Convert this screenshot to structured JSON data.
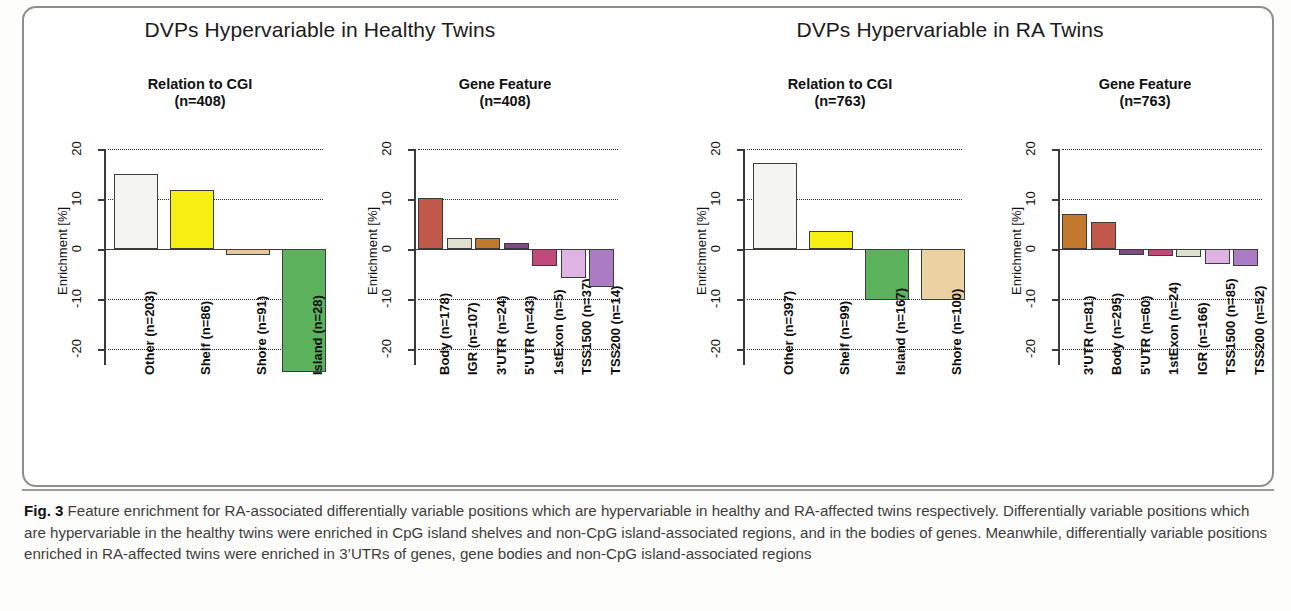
{
  "figure": {
    "label": "Fig. 3",
    "caption_text": " Feature enrichment for RA-associated differentially variable positions which are hypervariable in healthy and RA-affected twins respectively. Differentially variable positions which are hypervariable in the healthy twins were enriched in CpG island shelves and non-CpG island-associated regions, and in the bodies of genes. Meanwhile, differentially variable positions enriched in RA-affected twins were enriched in 3’UTRs of genes, gene bodies and non-CpG island-associated regions"
  },
  "groups": [
    {
      "title": "DVPs Hypervariable in Healthy Twins"
    },
    {
      "title": "DVPs Hypervariable in RA Twins"
    }
  ],
  "chart_data": [
    {
      "type": "bar",
      "title": "Relation to CGI",
      "subtitle": "(n=408)",
      "ylabel": "Enrichment [%]",
      "xlabel": "",
      "ylim": [
        -28,
        20
      ],
      "yticks": [
        20,
        10,
        0,
        -10,
        -20
      ],
      "ytick_labels": [
        "20",
        "10",
        "0",
        "-10",
        "-20"
      ],
      "grid": true,
      "categories": [
        "Other (n=203)",
        "Shelf (n=86)",
        "Shore (n=91)",
        "Island (n=28)"
      ],
      "values": [
        15.0,
        11.8,
        -1.2,
        -24.5
      ],
      "colors": [
        "#f4f4f2",
        "#f7ef13",
        "#e8c79a",
        "#5cb25d"
      ]
    },
    {
      "type": "bar",
      "title": "Gene Feature",
      "subtitle": "(n=408)",
      "ylabel": "Enrichment [%]",
      "xlabel": "",
      "ylim": [
        -28,
        20
      ],
      "yticks": [
        20,
        10,
        0,
        -10,
        -20
      ],
      "ytick_labels": [
        "20",
        "10",
        "0",
        "-10",
        "-20"
      ],
      "grid": true,
      "categories": [
        "Body (n=178)",
        "IGR (n=107)",
        "3'UTR (n=24)",
        "5'UTR (n=43)",
        "1stExon (n=5)",
        "TSS1500 (n=37)",
        "TSS200 (n=14)"
      ],
      "values": [
        10.3,
        2.3,
        2.2,
        1.3,
        -3.4,
        -5.7,
        -7.6
      ],
      "colors": [
        "#c0594a",
        "#dfe0ce",
        "#c2792e",
        "#7d4b86",
        "#c2497c",
        "#dfb4e4",
        "#ab7bc4"
      ]
    },
    {
      "type": "bar",
      "title": "Relation to CGI",
      "subtitle": "(n=763)",
      "ylabel": "Enrichment [%]",
      "xlabel": "",
      "ylim": [
        -28,
        20
      ],
      "yticks": [
        20,
        10,
        0,
        -10,
        -20
      ],
      "ytick_labels": [
        "20",
        "10",
        "0",
        "-10",
        "-20"
      ],
      "grid": true,
      "categories": [
        "Other (n=397)",
        "Shelf (n=99)",
        "Island (n=167)",
        "Shore (n=100)"
      ],
      "values": [
        17.3,
        3.6,
        -10.2,
        -10.2
      ],
      "colors": [
        "#f4f4f2",
        "#f7ef13",
        "#5cb25d",
        "#ecd2a2"
      ]
    },
    {
      "type": "bar",
      "title": "Gene Feature",
      "subtitle": "(n=763)",
      "ylabel": "Enrichment [%]",
      "xlabel": "",
      "ylim": [
        -28,
        20
      ],
      "yticks": [
        20,
        10,
        0,
        -10,
        -20
      ],
      "ytick_labels": [
        "20",
        "10",
        "0",
        "-10",
        "-20"
      ],
      "grid": true,
      "categories": [
        "3'UTR (n=81)",
        "Body (n=295)",
        "5'UTR (n=60)",
        "1stExon (n=24)",
        "IGR (n=166)",
        "TSS1500 (n=85)",
        "TSS200 (n=52)"
      ],
      "values": [
        7.0,
        5.5,
        -1.2,
        -1.4,
        -1.6,
        -3.0,
        -3.4
      ],
      "colors": [
        "#c2792e",
        "#c0594a",
        "#7d4b86",
        "#c2497c",
        "#dfe0ce",
        "#dfb4e4",
        "#ab7bc4"
      ]
    }
  ]
}
